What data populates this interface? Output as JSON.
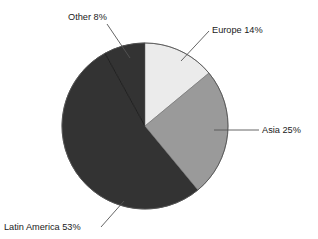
{
  "chart_data": {
    "type": "pie",
    "title": "",
    "subtitle": "",
    "xlabel": "",
    "ylabel": "",
    "legend_position": "none",
    "grid": false,
    "start_angle_deg": 0,
    "direction": "clockwise",
    "units": "percent",
    "total": 100,
    "categories": [
      "Europe",
      "Asia",
      "Latin America",
      "Other"
    ],
    "values": [
      14,
      25,
      53,
      8
    ],
    "labels": [
      "Europe 14%",
      "Asia 25%",
      "Latin America 53%",
      "Other 8%"
    ],
    "colors": [
      "#ebebeb",
      "#9a9a9a",
      "#333333",
      "#333333"
    ],
    "slices": [
      {
        "name": "Europe",
        "label": "Europe 14%",
        "value": 14,
        "color": "#ebebeb",
        "start_deg": 0,
        "end_deg": 50.4,
        "label_anchor": "start",
        "label_x": 212,
        "label_y": 33
      },
      {
        "name": "Asia",
        "label": "Asia 25%",
        "value": 25,
        "color": "#9a9a9a",
        "start_deg": 50.4,
        "end_deg": 140.4,
        "label_anchor": "start",
        "label_x": 262,
        "label_y": 133
      },
      {
        "name": "Latin America",
        "label": "Latin America 53%",
        "value": 53,
        "color": "#333333",
        "start_deg": 140.4,
        "end_deg": 331.2,
        "label_anchor": "start",
        "label_x": 4,
        "label_y": 230
      },
      {
        "name": "Other",
        "label": "Other 8%",
        "value": 8,
        "color": "#333333",
        "start_deg": 331.2,
        "end_deg": 360,
        "label_anchor": "start",
        "label_x": 68,
        "label_y": 20
      }
    ]
  },
  "chart": {
    "center_x": 145,
    "center_y": 126,
    "radius": 83,
    "outline_color": "#555555",
    "divider_color": "#111111",
    "leader_color": "#555555"
  }
}
